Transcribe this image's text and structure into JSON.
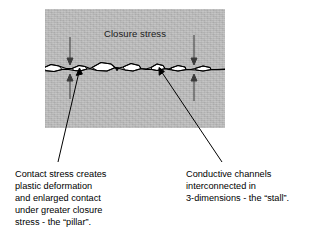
{
  "figure": {
    "background_color": "#ffffff",
    "panel": {
      "label": "specimen-cross-section",
      "fill_color": "#b9b9b9",
      "title": "Closure stress"
    },
    "interface": {
      "label": "rough-contact-interface",
      "void_fill_color": "#ffffff",
      "line_color": "#000000"
    },
    "arrows": {
      "color": "#3a3a3a",
      "items": [
        {
          "name": "closure-arrow-down-left",
          "direction": "down"
        },
        {
          "name": "closure-arrow-up-left",
          "direction": "up"
        },
        {
          "name": "closure-arrow-down-right",
          "direction": "down"
        },
        {
          "name": "closure-arrow-up-right",
          "direction": "up"
        }
      ]
    },
    "callouts": [
      {
        "name": "callout-pillar",
        "side": "left",
        "lines": [
          "Contact stress creates",
          "plastic deformation",
          "and enlarged contact",
          "under greater closure",
          "stress - the “pillar”."
        ]
      },
      {
        "name": "callout-stall",
        "side": "right",
        "lines": [
          "Conductive channels",
          "interconnected in",
          "3-dimensions - the “stall”."
        ]
      }
    ]
  }
}
